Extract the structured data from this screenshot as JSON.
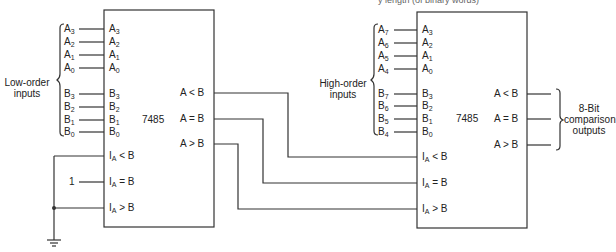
{
  "caption_fragment": "y length (of binary words)",
  "left_chip": {
    "part": "7485",
    "group_label": [
      "Low-order",
      "inputs"
    ],
    "external_inputs": [
      {
        "name": "A",
        "sub": "3"
      },
      {
        "name": "A",
        "sub": "2"
      },
      {
        "name": "A",
        "sub": "1"
      },
      {
        "name": "A",
        "sub": "0"
      },
      {
        "name": "B",
        "sub": "3"
      },
      {
        "name": "B",
        "sub": "2"
      },
      {
        "name": "B",
        "sub": "1"
      },
      {
        "name": "B",
        "sub": "0"
      }
    ],
    "pins": [
      {
        "name": "A",
        "sub": "3"
      },
      {
        "name": "A",
        "sub": "2"
      },
      {
        "name": "A",
        "sub": "1"
      },
      {
        "name": "A",
        "sub": "0"
      },
      {
        "name": "B",
        "sub": "3"
      },
      {
        "name": "B",
        "sub": "2"
      },
      {
        "name": "B",
        "sub": "1"
      },
      {
        "name": "B",
        "sub": "0"
      }
    ],
    "cascade_inputs": [
      {
        "name": "I",
        "sub": "A",
        "rest": " < B"
      },
      {
        "name": "I",
        "sub": "A",
        "rest": " = B"
      },
      {
        "name": "I",
        "sub": "A",
        "rest": " > B"
      }
    ],
    "outputs": [
      "A < B",
      "A = B",
      "A > B"
    ],
    "constant_input": "1"
  },
  "right_chip": {
    "part": "7485",
    "group_label": [
      "High-order",
      "inputs"
    ],
    "external_inputs": [
      {
        "name": "A",
        "sub": "7"
      },
      {
        "name": "A",
        "sub": "6"
      },
      {
        "name": "A",
        "sub": "5"
      },
      {
        "name": "A",
        "sub": "4"
      },
      {
        "name": "B",
        "sub": "7"
      },
      {
        "name": "B",
        "sub": "6"
      },
      {
        "name": "B",
        "sub": "5"
      },
      {
        "name": "B",
        "sub": "4"
      }
    ],
    "pins": [
      {
        "name": "A",
        "sub": "3"
      },
      {
        "name": "A",
        "sub": "2"
      },
      {
        "name": "A",
        "sub": "1"
      },
      {
        "name": "A",
        "sub": "0"
      },
      {
        "name": "B",
        "sub": "3"
      },
      {
        "name": "B",
        "sub": "2"
      },
      {
        "name": "B",
        "sub": "1"
      },
      {
        "name": "B",
        "sub": "0"
      }
    ],
    "cascade_inputs": [
      {
        "name": "I",
        "sub": "A",
        "rest": " < B"
      },
      {
        "name": "I",
        "sub": "A",
        "rest": " = B"
      },
      {
        "name": "I",
        "sub": "A",
        "rest": " > B"
      }
    ],
    "outputs": [
      "A < B",
      "A = B",
      "A > B"
    ],
    "output_group_label": [
      "8-Bit",
      "comparison",
      "outputs"
    ]
  }
}
